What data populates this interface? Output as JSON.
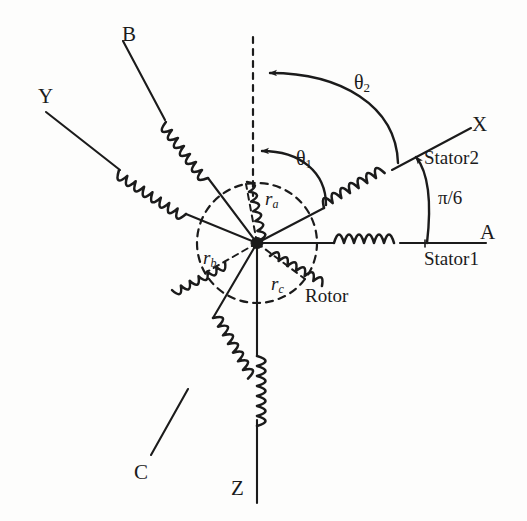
{
  "figure": {
    "kind": "electrical-machine-schematic",
    "stroke_color": "#1b1b1b",
    "background_color": "#fdfdfc"
  },
  "labels": {
    "axis_a": "A",
    "axis_b": "B",
    "axis_c": "C",
    "axis_x": "X",
    "axis_y": "Y",
    "axis_z": "Z",
    "stator1": "Stator1",
    "stator2": "Stator2",
    "rotor": "Rotor",
    "pi_over_six": "π/6"
  },
  "angles": {
    "theta1_symbol": "θ",
    "theta1_sub": "1",
    "theta2_symbol": "θ",
    "theta2_sub": "2",
    "offset_label": "π/6"
  },
  "rotor_windings": [
    {
      "symbol": "r",
      "sub": "a"
    },
    {
      "symbol": "r",
      "sub": "b"
    },
    {
      "symbol": "r",
      "sub": "c"
    }
  ],
  "stator1_phases": [
    "A",
    "B",
    "C"
  ],
  "stator2_phases": [
    "X",
    "Y",
    "Z"
  ],
  "geometry": {
    "center_x": 257,
    "center_y": 243,
    "rotor_radius": 60
  }
}
